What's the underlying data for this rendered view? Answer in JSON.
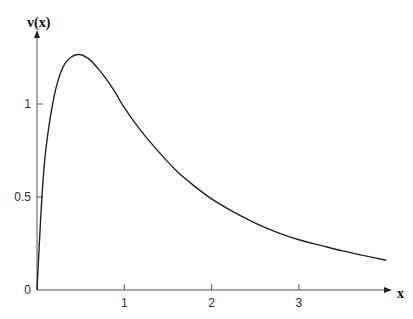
{
  "chart_data": {
    "type": "line",
    "title": "",
    "xlabel": "x",
    "ylabel": "v(x)",
    "xlim": [
      0,
      4.0
    ],
    "ylim": [
      0,
      1.35
    ],
    "grid": false,
    "legend": null,
    "x_ticks": [
      "1",
      "2",
      "3"
    ],
    "y_ticks": [
      "0",
      "0.5",
      "1"
    ],
    "series": [
      {
        "name": "v(x)",
        "x": [
          0,
          0.05,
          0.1,
          0.2,
          0.3,
          0.4,
          0.5,
          0.6,
          0.7,
          0.8,
          0.9,
          1.0,
          1.2,
          1.4,
          1.6,
          1.8,
          2.0,
          2.25,
          2.5,
          2.75,
          3.0,
          3.25,
          3.5,
          3.75,
          4.0
        ],
        "values": [
          0,
          0.45,
          0.75,
          1.05,
          1.2,
          1.255,
          1.265,
          1.24,
          1.19,
          1.13,
          1.06,
          0.98,
          0.85,
          0.74,
          0.64,
          0.56,
          0.49,
          0.42,
          0.36,
          0.31,
          0.27,
          0.24,
          0.21,
          0.185,
          0.16
        ]
      }
    ]
  },
  "axes": {
    "x_label": "x",
    "y_label": "v(x)",
    "origin_label": "0"
  },
  "colors": {
    "curve": "#222222",
    "axis": "#555555"
  }
}
